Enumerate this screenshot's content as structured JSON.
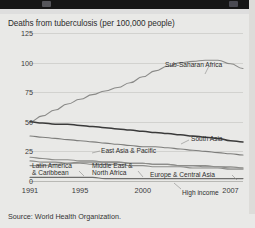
{
  "window": {
    "chrome_bar_color": "#161616"
  },
  "figure": {
    "title": "Deaths from tuberculosis (per 100,000 people)",
    "source": "Source: World Health Organization."
  },
  "chart_data": {
    "type": "line",
    "title": "Deaths from tuberculosis (per 100,000 people)",
    "xlabel": "",
    "ylabel": "",
    "ylim": [
      0,
      125
    ],
    "xlim": [
      1991,
      2008
    ],
    "yticks": [
      "0",
      "25",
      "50",
      "75",
      "100",
      "125"
    ],
    "ytick_values": [
      0,
      25,
      50,
      75,
      100,
      125
    ],
    "xticks": [
      "1991",
      "1995",
      "2000",
      "2007"
    ],
    "xtick_values": [
      1991,
      1995,
      2000,
      2007
    ],
    "grid": "horizontal",
    "legend": "inline-labels",
    "x": [
      1991,
      1992,
      1993,
      1994,
      1995,
      1996,
      1997,
      1998,
      1999,
      2000,
      2001,
      2002,
      2003,
      2004,
      2005,
      2006,
      2007,
      2008
    ],
    "series": [
      {
        "name": "Sub-Saharan Africa",
        "color": "#8a8a88",
        "label_x": 165,
        "label_y": 47,
        "values": [
          50,
          55,
          60,
          65,
          69,
          73,
          76,
          79,
          83,
          88,
          93,
          97,
          100,
          101,
          102,
          102,
          99,
          95
        ]
      },
      {
        "name": "South Asia",
        "color": "#3a3a3a",
        "label_x": 191,
        "label_y": 121,
        "values": [
          50,
          49,
          48,
          48,
          47,
          46,
          45,
          44,
          43,
          42,
          41,
          40,
          39,
          38,
          37,
          36,
          34,
          33
        ]
      },
      {
        "name": "East Asia & Pacific",
        "color": "#7e7e7c",
        "label_x": 101,
        "label_y": 133,
        "values": [
          38,
          37,
          36,
          35,
          34,
          33,
          32,
          31,
          30,
          29,
          29,
          28,
          27,
          26,
          25,
          24,
          23,
          22
        ]
      },
      {
        "name": "Latin America\n& Caribbean",
        "color": "#8d8d8a",
        "label_x": 32,
        "label_y": 148,
        "values": [
          20,
          19,
          18,
          18,
          17,
          17,
          16,
          16,
          15,
          15,
          14,
          14,
          13,
          13,
          13,
          12,
          12,
          11
        ]
      },
      {
        "name": "Middle East &\nNorth Africa",
        "color": "#8d8d8a",
        "label_x": 92,
        "label_y": 148,
        "values": [
          17,
          16,
          16,
          15,
          15,
          14,
          14,
          14,
          13,
          13,
          12,
          12,
          12,
          11,
          11,
          11,
          10,
          10
        ]
      },
      {
        "name": "Europe & Central Asia",
        "color": "#8d8d8a",
        "label_x": 150,
        "label_y": 157,
        "values": [
          13,
          13,
          14,
          15,
          16,
          16,
          16,
          16,
          15,
          15,
          14,
          14,
          13,
          13,
          12,
          12,
          11,
          11
        ]
      },
      {
        "name": "High income",
        "color": "#6e6e6c",
        "label_x": 182,
        "label_y": 175,
        "values": [
          3,
          3,
          3,
          3,
          3,
          3,
          2,
          2,
          2,
          2,
          2,
          2,
          2,
          2,
          2,
          2,
          2,
          2
        ]
      }
    ]
  }
}
